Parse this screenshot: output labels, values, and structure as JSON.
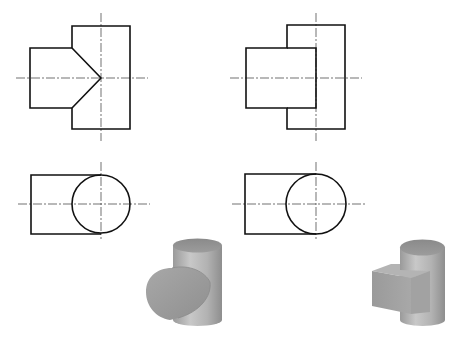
{
  "diagram": {
    "type": "orthographic-projection-exercise",
    "figures": [
      {
        "id": "left-set",
        "front_view": "cylinder-cylinder-intersection (V-shaped intersection line)",
        "top_view": "rectangle with circle",
        "model_3d": "two intersecting cylinders (T-pipe)"
      },
      {
        "id": "right-set",
        "front_view": "rectangular prism meeting cylinder",
        "top_view": "rectangle with circle",
        "model_3d": "square prism intersecting a vertical cylinder"
      }
    ],
    "colors": {
      "line": "#111111",
      "centerline": "#333333",
      "shade_light": "#bdbdbd",
      "shade_mid": "#a0a0a0",
      "shade_dark": "#858585",
      "background": "#ffffff"
    }
  }
}
